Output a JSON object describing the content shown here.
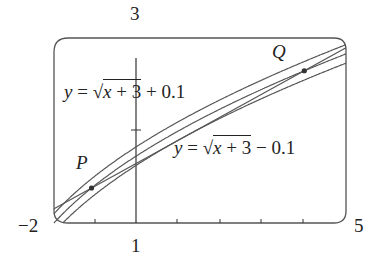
{
  "figure": {
    "window": {
      "xmin": -2,
      "xmax": 5,
      "ymin": 1,
      "ymax": 3
    },
    "axis_labels": {
      "xmin": "−2",
      "xmax": "5",
      "ymin": "1",
      "ymax": "3"
    },
    "curves": [
      {
        "name": "upper",
        "expr_prefix": "y = ",
        "radicand": "x + 3",
        "suffix": " + 0.1",
        "offset": 0.1
      },
      {
        "name": "main",
        "expr": "y = √(x + 3)",
        "offset": 0
      },
      {
        "name": "lower",
        "expr_prefix": "y = ",
        "radicand": "x + 3",
        "suffix": " − 0.1",
        "offset": -0.1
      }
    ],
    "points": [
      {
        "label": "P",
        "x": -1.1
      },
      {
        "label": "Q",
        "x": 4.0
      }
    ],
    "secant": "line through P and Q"
  }
}
